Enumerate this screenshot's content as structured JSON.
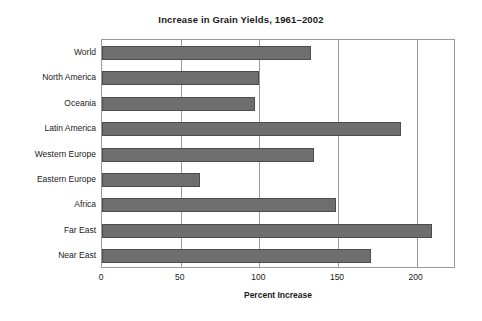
{
  "chart_data": {
    "type": "bar",
    "orientation": "horizontal",
    "title": "Increase in Grain Yields, 1961–2002",
    "xlabel": "Percent Increase",
    "ylabel": "",
    "categories": [
      "World",
      "North America",
      "Oceania",
      "Latin America",
      "Western Europe",
      "Eastern Europe",
      "Africa",
      "Far East",
      "Near East"
    ],
    "values": [
      133,
      100,
      97,
      190,
      135,
      62,
      149,
      210,
      171
    ],
    "xlim": [
      0,
      225
    ],
    "xticks": [
      0,
      50,
      100,
      150,
      200
    ],
    "xtick_labels": [
      "0",
      "50",
      "100",
      "150",
      "200"
    ],
    "grid": "vertical",
    "legend": null,
    "bar_color": "#6e6e6e",
    "bar_edge_color": "#4d4d4d",
    "frame_color": "#9a9a9a",
    "background": "#ffffff"
  }
}
